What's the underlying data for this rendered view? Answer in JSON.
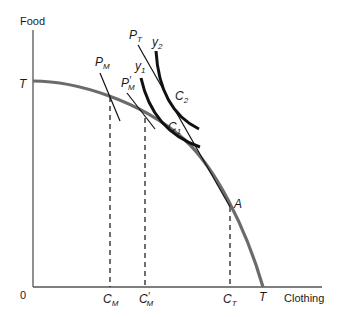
{
  "axes": {
    "y_label": "Food",
    "x_label": "Clothing",
    "origin": "0"
  },
  "curves": {
    "ppf": {
      "end_y_label": "T",
      "end_x_label": "T",
      "color": "#6b6b6b"
    },
    "indifference_y1": {
      "label": "y",
      "sub": "1"
    },
    "indifference_y2": {
      "label": "y",
      "sub": "2"
    },
    "price_line_PM": {
      "label": "P",
      "sub": "M"
    },
    "price_line_PM_prime": {
      "label": "P",
      "sub": "M",
      "prime": "′"
    },
    "price_line_PT": {
      "label": "P",
      "sub": "T"
    }
  },
  "points": {
    "C1": {
      "label": "C",
      "sub": "1"
    },
    "C2": {
      "label": "C",
      "sub": "2"
    },
    "A": {
      "label": "A"
    }
  },
  "x_ticks": {
    "CM": {
      "label": "C",
      "sub": "M"
    },
    "CM_prime": {
      "label": "C",
      "sub": "M",
      "prime": "′"
    },
    "CT": {
      "label": "C",
      "sub": "T"
    },
    "T": {
      "label": "T"
    }
  },
  "colors": {
    "axis": "#555555",
    "ppf": "#6b6b6b",
    "curve": "#111111",
    "text": "#1a1a1a"
  }
}
